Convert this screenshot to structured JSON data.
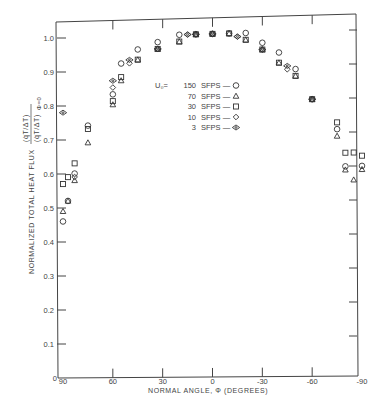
{
  "chart_data": {
    "type": "scatter",
    "title": "",
    "xlabel": "NORMAL ANGLE, Φ (DEGREES)",
    "ylabel": "NORMALIZED TOTAL HEAT FLUX",
    "ylabel_fraction": {
      "numerator": "(q̇T/ΔT)",
      "denominator": "(q̇T/ΔT)Φ=0"
    },
    "xlim": [
      90,
      -90
    ],
    "ylim": [
      0,
      1.05
    ],
    "x_ticks": [
      90,
      60,
      30,
      0,
      -30,
      -60,
      -90
    ],
    "x_tick_labels": [
      "90",
      "60",
      "30",
      "0",
      "-30",
      "-60",
      "-90"
    ],
    "y_ticks": [
      0,
      0.1,
      0.2,
      0.3,
      0.4,
      0.5,
      0.6,
      0.7,
      0.8,
      0.9,
      1.0
    ],
    "y_tick_labels": [
      "0",
      "0.1",
      "0.2",
      "0.3",
      "0.4",
      "0.5",
      "0.6",
      "0.7",
      "0.8",
      "0.9",
      "1.0"
    ],
    "grid": false,
    "legend_position": "upper-center-right",
    "legend_title": "U₀=",
    "series": [
      {
        "name": "150 SFPS",
        "marker": "circle",
        "points": [
          [
            90,
            0.46
          ],
          [
            87,
            0.52
          ],
          [
            83,
            0.6
          ],
          [
            75,
            0.74
          ],
          [
            60,
            0.83
          ],
          [
            55,
            0.92
          ],
          [
            45,
            0.96
          ],
          [
            33,
            0.98
          ],
          [
            20,
            1.0
          ],
          [
            10,
            1.0
          ],
          [
            0,
            1.0
          ],
          [
            -10,
            1.0
          ],
          [
            -20,
            1.0
          ],
          [
            -30,
            0.97
          ],
          [
            -40,
            0.94
          ],
          [
            -50,
            0.89
          ],
          [
            -60,
            0.8
          ],
          [
            -75,
            0.71
          ],
          [
            -80,
            0.6
          ],
          [
            -90,
            0.6
          ]
        ]
      },
      {
        "name": "70 SFPS",
        "marker": "triangle",
        "points": [
          [
            90,
            0.49
          ],
          [
            87,
            0.52
          ],
          [
            83,
            0.58
          ],
          [
            75,
            0.69
          ],
          [
            60,
            0.8
          ],
          [
            55,
            0.87
          ],
          [
            45,
            0.93
          ],
          [
            33,
            0.96
          ],
          [
            20,
            0.98
          ],
          [
            10,
            1.0
          ],
          [
            0,
            1.0
          ],
          [
            -10,
            1.0
          ],
          [
            -20,
            0.98
          ],
          [
            -30,
            0.95
          ],
          [
            -40,
            0.91
          ],
          [
            -50,
            0.87
          ],
          [
            -60,
            0.8
          ],
          [
            -75,
            0.69
          ],
          [
            -80,
            0.59
          ],
          [
            -85,
            0.56
          ],
          [
            -90,
            0.59
          ]
        ]
      },
      {
        "name": "30 SFPS",
        "marker": "square",
        "points": [
          [
            90,
            0.57
          ],
          [
            87,
            0.59
          ],
          [
            83,
            0.63
          ],
          [
            75,
            0.73
          ],
          [
            60,
            0.81
          ],
          [
            55,
            0.88
          ],
          [
            45,
            0.93
          ],
          [
            33,
            0.96
          ],
          [
            20,
            0.98
          ],
          [
            10,
            1.0
          ],
          [
            0,
            1.0
          ],
          [
            -10,
            1.0
          ],
          [
            -20,
            0.98
          ],
          [
            -30,
            0.95
          ],
          [
            -40,
            0.91
          ],
          [
            -50,
            0.87
          ],
          [
            -60,
            0.8
          ],
          [
            -75,
            0.73
          ],
          [
            -80,
            0.64
          ],
          [
            -85,
            0.64
          ],
          [
            -90,
            0.63
          ]
        ]
      },
      {
        "name": "10 SFPS",
        "marker": "diamond",
        "points": [
          [
            83,
            0.59
          ],
          [
            60,
            0.85
          ],
          [
            50,
            0.92
          ],
          [
            33,
            0.96
          ],
          [
            15,
            1.0
          ],
          [
            10,
            1.0
          ],
          [
            0,
            1.0
          ],
          [
            -15,
            0.99
          ],
          [
            -30,
            0.95
          ],
          [
            -45,
            0.89
          ],
          [
            -60,
            0.8
          ]
        ]
      },
      {
        "name": "3 SFPS",
        "marker": "eye",
        "points": [
          [
            90,
            0.78
          ],
          [
            60,
            0.87
          ],
          [
            50,
            0.93
          ],
          [
            33,
            0.96
          ],
          [
            15,
            1.0
          ],
          [
            10,
            1.0
          ],
          [
            0,
            1.0
          ],
          [
            -15,
            0.99
          ],
          [
            -30,
            0.95
          ],
          [
            -45,
            0.9
          ],
          [
            -60,
            0.8
          ]
        ]
      }
    ]
  },
  "labels": {
    "xlabel": "NORMAL ANGLE, Φ (DEGREES)",
    "ylabel_main": "NORMALIZED TOTAL HEAT FLUX",
    "ylabel_num": "(q̇T/ΔT)",
    "ylabel_den": "(q̇T/ΔT)",
    "ylabel_sub": "Φ=0",
    "legend_prefix": "U₀=",
    "legend_items": [
      {
        "value": "150",
        "unit": "SFPS —"
      },
      {
        "value": "70",
        "unit": "SFPS —"
      },
      {
        "value": "30",
        "unit": "SFPS —"
      },
      {
        "value": "10",
        "unit": "SFPS —"
      },
      {
        "value": "3",
        "unit": "SFPS —"
      }
    ],
    "x_tick_labels": [
      "90",
      "60",
      "30",
      "0",
      "-30",
      "-60",
      "-90"
    ],
    "y_tick_labels": [
      "0",
      "0.1",
      "0.2",
      "0.3",
      "0.4",
      "0.5",
      "0.6",
      "0.7",
      "0.8",
      "0.9",
      "1.0"
    ]
  }
}
